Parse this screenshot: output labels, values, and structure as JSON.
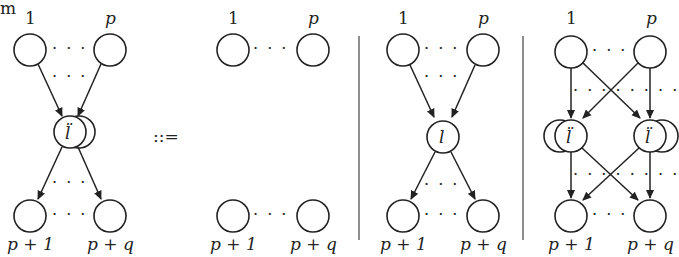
{
  "corner_text": "m",
  "definition_symbol": "::=",
  "labels": {
    "first": "1",
    "pth": "p",
    "first_out": "p + 1",
    "last_out": "p + q"
  },
  "node_symbols": {
    "ddot_l": "l̈",
    "l": "l"
  },
  "dots": "· · ·",
  "panels": [
    {
      "name": "lhs-ddot-l-hub",
      "description": "p inputs to stacked l-double-dot node, q outputs"
    },
    {
      "name": "rhs-empty",
      "description": "p inputs and q outputs unconnected"
    },
    {
      "name": "rhs-single-l",
      "description": "p inputs through single l node to q outputs"
    },
    {
      "name": "rhs-crossed-ddot-l",
      "description": "p inputs fully connected to two stacked l-double-dot nodes, each fully connected to q outputs"
    }
  ],
  "colors": {
    "stroke": "#222222",
    "background": "#ffffff"
  }
}
